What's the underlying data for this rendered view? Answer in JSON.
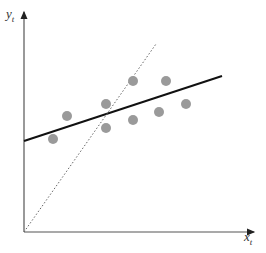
{
  "chart_data": {
    "type": "scatter",
    "title": "",
    "xlabel": "x",
    "xlabel_sub": "t",
    "ylabel": "y",
    "ylabel_sub": "t",
    "grid": false,
    "legend": null,
    "ticks": false,
    "axes": {
      "origin_px": [
        24,
        232
      ],
      "x_end_px": [
        254,
        232
      ],
      "y_end_px": [
        24,
        12
      ],
      "color": "#555555"
    },
    "points": [
      {
        "x": 53,
        "y": 139
      },
      {
        "x": 67,
        "y": 116
      },
      {
        "x": 106,
        "y": 104
      },
      {
        "x": 106,
        "y": 128
      },
      {
        "x": 133,
        "y": 81
      },
      {
        "x": 133,
        "y": 120
      },
      {
        "x": 159,
        "y": 112
      },
      {
        "x": 166,
        "y": 81
      },
      {
        "x": 186,
        "y": 104
      }
    ],
    "point_color": "#9a9a9a",
    "point_radius": 5,
    "lines": [
      {
        "name": "fitted-regression-line",
        "style": "solid",
        "color": "#111111",
        "width": 2,
        "from": [
          24,
          141
        ],
        "to": [
          222,
          76
        ]
      },
      {
        "name": "reference-line",
        "style": "dotted",
        "color": "#666666",
        "width": 1,
        "from": [
          24,
          232
        ],
        "to": [
          156,
          44
        ]
      }
    ]
  }
}
